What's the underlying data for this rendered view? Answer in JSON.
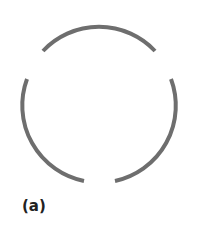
{
  "figure": {
    "label": "(a)",
    "stroke_color": "#6e6e6e",
    "arcs": [
      {
        "name": "top-arc",
        "d": "M 43 51 A 77 77 0 0 1 155 51"
      },
      {
        "name": "left-arc",
        "d": "M 27 79 A 77 77 0 0 0 84 181"
      },
      {
        "name": "right-arc",
        "d": "M 171 79 A 77 77 0 0 1 115 181"
      }
    ]
  }
}
